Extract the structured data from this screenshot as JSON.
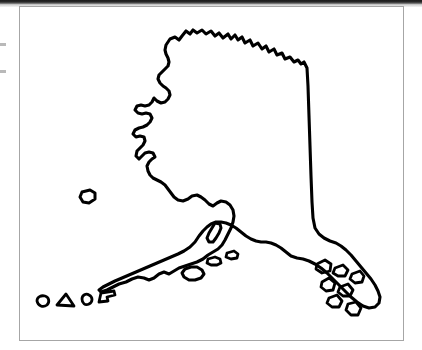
{
  "document": {
    "type": "scanned-page",
    "background_color": "#ffffff",
    "frame": {
      "border_color": "#a6a6a6",
      "x": 19,
      "y": 6,
      "width": 385,
      "height": 335
    },
    "scan_band": {
      "color": "#1b1b1b",
      "height": 5
    },
    "margin_ticks": [
      {
        "name": "tick-upper",
        "y": 43,
        "color": "#b9b9b9"
      },
      {
        "name": "tick-lower",
        "y": 70,
        "color": "#b9b9b9"
      }
    ]
  },
  "map": {
    "subject": "Alaska",
    "style": "outline",
    "stroke_color": "#000000",
    "fill_color": "none",
    "stroke_width": 3,
    "features": [
      {
        "name": "alaska-mainland",
        "type": "coastline-outline"
      },
      {
        "name": "aleutian-island-oval",
        "type": "island"
      },
      {
        "name": "aleutian-island-triangle",
        "type": "island"
      },
      {
        "name": "aleutian-island-round",
        "type": "island"
      },
      {
        "name": "aleutian-island-wedge",
        "type": "island"
      },
      {
        "name": "nunivak-island",
        "type": "island"
      },
      {
        "name": "kodiak-island",
        "type": "island"
      },
      {
        "name": "afognak-island",
        "type": "island"
      },
      {
        "name": "southwest-island-small",
        "type": "island"
      },
      {
        "name": "panhandle-island-1",
        "type": "island"
      },
      {
        "name": "panhandle-island-2",
        "type": "island"
      },
      {
        "name": "panhandle-island-3",
        "type": "island"
      },
      {
        "name": "panhandle-island-4",
        "type": "island"
      },
      {
        "name": "panhandle-island-5",
        "type": "island"
      },
      {
        "name": "panhandle-island-6",
        "type": "island"
      },
      {
        "name": "panhandle-island-7",
        "type": "island"
      }
    ]
  }
}
